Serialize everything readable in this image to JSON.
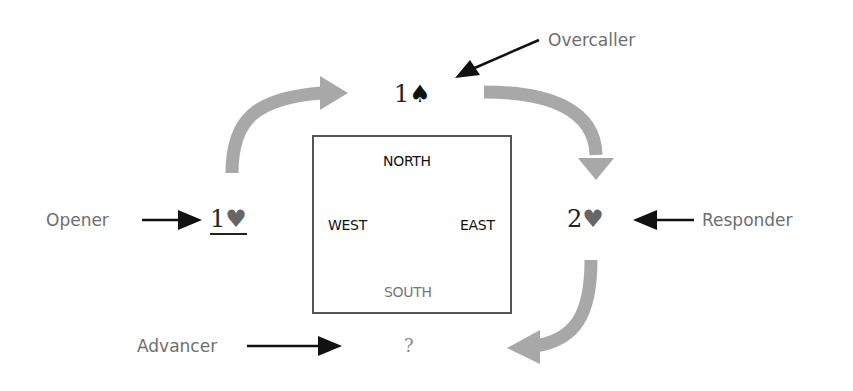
{
  "diagram": {
    "table": {
      "north": "NORTH",
      "west": "WEST",
      "east": "EAST",
      "south": "SOUTH"
    },
    "bids": {
      "opener": {
        "level": "1",
        "suit": "♥",
        "underlined": true
      },
      "overcaller": {
        "level": "1",
        "suit": "♠"
      },
      "responder": {
        "level": "2",
        "suit": "♥"
      },
      "advancer": {
        "level": "?",
        "suit": ""
      }
    },
    "roles": {
      "opener": "Opener",
      "overcaller": "Overcaller",
      "responder": "Responder",
      "advancer": "Advancer"
    },
    "colors": {
      "flow_arrow": "#a8a8a8",
      "pointer_arrow": "#111111",
      "label_text": "#6e6e6e",
      "box_border": "#555555"
    }
  }
}
